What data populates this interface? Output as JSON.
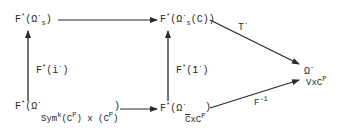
{
  "diagram": {
    "type": "commutative-diagram",
    "nodes": {
      "top_left": {
        "F": "F",
        "star": "*",
        "open": "(",
        "omega": "Ω",
        "dot": "·",
        "sub": "s",
        "close": ")"
      },
      "top_right": {
        "F": "F",
        "star": "*",
        "open": "(",
        "omega": "Ω",
        "dot": "·",
        "sub": "s",
        "inner": "(C))"
      },
      "bottom_left": {
        "F": "F",
        "star": "*",
        "open": "(",
        "omega": "Ω",
        "dot": "·",
        "sub_a": "Sym",
        "sub_k": "k",
        "sub_b": "(C",
        "sub_p": "P",
        "sub_c": ") x (C",
        "sub_p2": "P",
        "sub_d": ")",
        "close": ")"
      },
      "bottom_right": {
        "F": "F",
        "star": "*",
        "open": "(",
        "omega": "Ω",
        "dot": "·",
        "sub_a": "C",
        "sub_b": "xC",
        "sub_p": "P",
        "close": ")"
      },
      "right": {
        "omega": "Ω",
        "dot": "·",
        "sub_a": "V",
        "sub_b": "xC",
        "sub_p": "P"
      }
    },
    "arrows": {
      "left_vertical": {
        "F": "F",
        "star": "*",
        "arg": "(i",
        "dot": "·",
        "close": ")"
      },
      "right_vertical": {
        "F": "F",
        "star": "*",
        "arg": "(ī",
        "dot": "·",
        "close": ")"
      },
      "diag_top": {
        "label": "T",
        "dot": "·"
      },
      "diag_bottom": {
        "label": "F",
        "sup": "-1"
      }
    },
    "colors": {
      "ink": "#2a2a2a",
      "background": "#ffffff"
    }
  }
}
